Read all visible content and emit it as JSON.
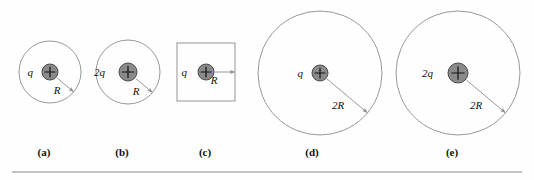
{
  "figure": {
    "type": "physics-diagram",
    "background_color": "#fefefe",
    "outline_color": "#8c8c8c",
    "charge_fill_color": "#8a8a8a",
    "charge_stroke_color": "#4a4a4a",
    "label_color": "#111111",
    "rule_color": "#c2c2c2"
  },
  "panels": [
    {
      "id": "a",
      "label": "(a)",
      "label_x": 44,
      "label_y": 146,
      "surface_shape": "circle",
      "center_x": 50,
      "center_y": 72,
      "radius": 31,
      "charge_label": "q",
      "charge_sign": "+",
      "charge_radius": 8,
      "charge_label_x": 33,
      "charge_label_y": 76,
      "radius_label": "R",
      "radius_label_x": 57,
      "radius_label_y": 94,
      "arrow_angle_deg": 40
    },
    {
      "id": "b",
      "label": "(b)",
      "label_x": 122,
      "label_y": 146,
      "surface_shape": "circle",
      "center_x": 128,
      "center_y": 72,
      "radius": 32,
      "charge_label": "2q",
      "charge_sign": "+",
      "charge_radius": 9,
      "charge_label_x": 105,
      "charge_label_y": 76,
      "radius_label": "R",
      "radius_label_x": 136,
      "radius_label_y": 95,
      "arrow_angle_deg": 40
    },
    {
      "id": "c",
      "label": "(c)",
      "label_x": 205,
      "label_y": 146,
      "surface_shape": "square",
      "center_x": 206,
      "center_y": 72,
      "half_side": 29,
      "charge_label": "q",
      "charge_sign": "+",
      "charge_radius": 8,
      "charge_label_x": 187,
      "charge_label_y": 76,
      "radius_label": "R",
      "radius_label_x": 214,
      "radius_label_y": 84,
      "arrow_angle_deg": 0
    },
    {
      "id": "d",
      "label": "(d)",
      "label_x": 312,
      "label_y": 146,
      "surface_shape": "circle",
      "center_x": 320,
      "center_y": 73,
      "radius": 62,
      "charge_label": "q",
      "charge_sign": "+",
      "charge_radius": 8,
      "charge_label_x": 303,
      "charge_label_y": 77,
      "radius_label": "2R",
      "radius_label_x": 338,
      "radius_label_y": 109,
      "arrow_angle_deg": 40
    },
    {
      "id": "e",
      "label": "(e)",
      "label_x": 452,
      "label_y": 146,
      "surface_shape": "circle",
      "center_x": 458,
      "center_y": 73,
      "radius": 62,
      "charge_label": "2q",
      "charge_sign": "+",
      "charge_radius": 10,
      "charge_label_x": 433,
      "charge_label_y": 77,
      "radius_label": "2R",
      "radius_label_x": 476,
      "radius_label_y": 109,
      "arrow_angle_deg": 40
    }
  ],
  "baseline_rule": {
    "x": 12,
    "y": 171,
    "width": 510
  }
}
